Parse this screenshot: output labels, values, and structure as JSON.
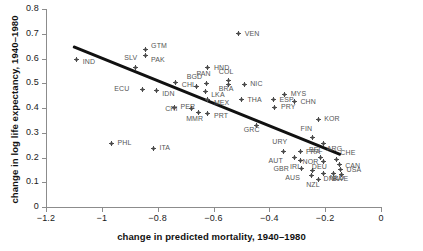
{
  "chart_data": {
    "type": "scatter",
    "title": "",
    "xlabel": "change in predicted mortality, 1940–1980",
    "ylabel": "change in log life expectancy, 1940–1980",
    "xlim": [
      -1.2,
      0.0
    ],
    "ylim": [
      0.0,
      0.8
    ],
    "xticks": [
      "−1.2",
      "−1",
      "−0.8",
      "−0.6",
      "−0.4",
      "−0.2",
      "0"
    ],
    "xtickvalues": [
      -1.2,
      -1.0,
      -0.8,
      -0.6,
      -0.4,
      -0.2,
      0.0
    ],
    "yticks": [
      "0",
      "0.1",
      "0.2",
      "0.3",
      "0.4",
      "0.5",
      "0.6",
      "0.7",
      "0.8"
    ],
    "ytickvalues": [
      0.0,
      0.1,
      0.2,
      0.3,
      0.4,
      0.5,
      0.6,
      0.7,
      0.8
    ],
    "grid": false,
    "legend": null,
    "marker_color": "#4a4a4a",
    "line_color": "#111111",
    "axis_color": "#8c8c8c",
    "fit_line": {
      "label": "regression line",
      "x0": -1.105,
      "y0": 0.647,
      "x1": -0.145,
      "y1": 0.21
    },
    "points": [
      {
        "label": "IND",
        "x": -1.09,
        "y": 0.596,
        "lx": 6,
        "ly": 3
      },
      {
        "label": "SLV",
        "x": -0.88,
        "y": 0.565,
        "lx": -3,
        "ly": -9
      },
      {
        "label": "GTM",
        "x": -0.845,
        "y": 0.636,
        "lx": 6,
        "ly": -4
      },
      {
        "label": "PAK",
        "x": -0.845,
        "y": 0.611,
        "lx": 6,
        "ly": 4
      },
      {
        "label": "ECU",
        "x": -0.855,
        "y": 0.475,
        "lx": -20,
        "ly": 0
      },
      {
        "label": "IDN",
        "x": -0.805,
        "y": 0.47,
        "lx": 6,
        "ly": 3
      },
      {
        "label": "CHL",
        "x": -0.735,
        "y": 0.505,
        "lx": 6,
        "ly": 3
      },
      {
        "label": "PER",
        "x": -0.74,
        "y": 0.404,
        "lx": 6,
        "ly": 0
      },
      {
        "label": "PHL",
        "x": -0.965,
        "y": 0.258,
        "lx": 6,
        "ly": 0
      },
      {
        "label": "ITA",
        "x": -0.815,
        "y": 0.237,
        "lx": 6,
        "ly": 0
      },
      {
        "label": "BGD",
        "x": -0.66,
        "y": 0.487,
        "lx": -2,
        "ly": -9
      },
      {
        "label": "PAN",
        "x": -0.625,
        "y": 0.499,
        "lx": -2,
        "ly": -9
      },
      {
        "label": "HND",
        "x": -0.62,
        "y": 0.562,
        "lx": 6,
        "ly": 0
      },
      {
        "label": "COL",
        "x": -0.545,
        "y": 0.511,
        "lx": -2,
        "ly": -9
      },
      {
        "label": "BRA",
        "x": -0.545,
        "y": 0.496,
        "lx": -2,
        "ly": 5
      },
      {
        "label": "NIC",
        "x": -0.49,
        "y": 0.496,
        "lx": 6,
        "ly": 0
      },
      {
        "label": "VEN",
        "x": -0.51,
        "y": 0.699,
        "lx": 6,
        "ly": 0
      },
      {
        "label": "LKA",
        "x": -0.63,
        "y": 0.466,
        "lx": 6,
        "ly": 3
      },
      {
        "label": "MEX",
        "x": -0.62,
        "y": 0.434,
        "lx": 6,
        "ly": 3
      },
      {
        "label": "CRI",
        "x": -0.68,
        "y": 0.396,
        "lx": -18,
        "ly": 0
      },
      {
        "label": "PRT",
        "x": -0.62,
        "y": 0.379,
        "lx": 6,
        "ly": 3
      },
      {
        "label": "MMR",
        "x": -0.655,
        "y": 0.381,
        "lx": -4,
        "ly": 6
      },
      {
        "label": "THA",
        "x": -0.5,
        "y": 0.434,
        "lx": 6,
        "ly": 0
      },
      {
        "label": "ESP",
        "x": -0.385,
        "y": 0.433,
        "lx": 6,
        "ly": 0
      },
      {
        "label": "MYS",
        "x": -0.345,
        "y": 0.455,
        "lx": 6,
        "ly": 0
      },
      {
        "label": "CHN",
        "x": -0.31,
        "y": 0.426,
        "lx": 6,
        "ly": 0
      },
      {
        "label": "PRY",
        "x": -0.38,
        "y": 0.404,
        "lx": 6,
        "ly": 0
      },
      {
        "label": "GRC",
        "x": -0.445,
        "y": 0.33,
        "lx": -5,
        "ly": 5
      },
      {
        "label": "KOR",
        "x": -0.225,
        "y": 0.355,
        "lx": 6,
        "ly": 0
      },
      {
        "label": "FIN",
        "x": -0.245,
        "y": 0.28,
        "lx": -4,
        "ly": -9
      },
      {
        "label": "ARG",
        "x": -0.205,
        "y": 0.256,
        "lx": 3,
        "ly": 5
      },
      {
        "label": "URY",
        "x": -0.35,
        "y": 0.225,
        "lx": -3,
        "ly": -9
      },
      {
        "label": "FRA",
        "x": -0.29,
        "y": 0.224,
        "lx": 6,
        "ly": 0
      },
      {
        "label": "AUT",
        "x": -0.31,
        "y": 0.198,
        "lx": -18,
        "ly": 3
      },
      {
        "label": "IRL",
        "x": -0.29,
        "y": 0.186,
        "lx": -2,
        "ly": 6
      },
      {
        "label": "BEL",
        "x": -0.215,
        "y": 0.2,
        "lx": -4,
        "ly": -8
      },
      {
        "label": "DEU",
        "x": -0.205,
        "y": 0.183,
        "lx": -4,
        "ly": 5
      },
      {
        "label": "CHE",
        "x": -0.16,
        "y": 0.193,
        "lx": 4,
        "ly": -6
      },
      {
        "label": "CAN",
        "x": -0.15,
        "y": 0.172,
        "lx": 6,
        "ly": 2
      },
      {
        "label": "USA",
        "x": -0.145,
        "y": 0.152,
        "lx": 6,
        "ly": 1
      },
      {
        "label": "GBR",
        "x": -0.285,
        "y": 0.155,
        "lx": -20,
        "ly": 0
      },
      {
        "label": "NOR",
        "x": -0.245,
        "y": 0.148,
        "lx": -2,
        "ly": -8
      },
      {
        "label": "NLD",
        "x": -0.205,
        "y": 0.134,
        "lx": 6,
        "ly": 4
      },
      {
        "label": "DNK",
        "x": -0.17,
        "y": 0.134,
        "lx": -2,
        "ly": 5
      },
      {
        "label": "SWE",
        "x": -0.14,
        "y": 0.133,
        "lx": -2,
        "ly": 5
      },
      {
        "label": "AUS",
        "x": -0.25,
        "y": 0.128,
        "lx": -18,
        "ly": 3
      },
      {
        "label": "NZL",
        "x": -0.225,
        "y": 0.113,
        "lx": -4,
        "ly": 6
      }
    ]
  }
}
